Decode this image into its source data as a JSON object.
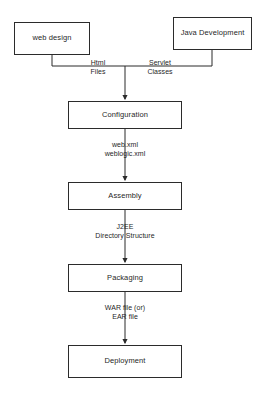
{
  "diagram": {
    "type": "flowchart",
    "background_color": "#ffffff",
    "line_color": "#2b2b2b",
    "text_color": "#1f1f1f",
    "nodes": [
      {
        "id": "web-design",
        "label": "web design",
        "x": 14,
        "y": 22,
        "w": 76,
        "h": 33
      },
      {
        "id": "java-development",
        "label": "Java Development",
        "x": 173,
        "y": 17,
        "w": 79,
        "h": 33
      },
      {
        "id": "configuration",
        "label": "Configuration",
        "x": 68,
        "y": 101,
        "w": 114,
        "h": 28
      },
      {
        "id": "assembly",
        "label": "Assembly",
        "x": 68,
        "y": 182,
        "w": 114,
        "h": 28
      },
      {
        "id": "packaging",
        "label": "Packaging",
        "x": 68,
        "y": 264,
        "w": 114,
        "h": 28
      },
      {
        "id": "deployment",
        "label": "Deployment",
        "x": 68,
        "y": 345,
        "w": 114,
        "h": 33
      }
    ],
    "edge_labels": [
      {
        "id": "html-files",
        "lines": [
          "Html",
          "Files"
        ],
        "from": "web-design",
        "to": "configuration",
        "x": 72,
        "y": 60
      },
      {
        "id": "servlet-classes",
        "lines": [
          "Servlet",
          "Classes"
        ],
        "from": "java-development",
        "to": "configuration",
        "x": 133,
        "y": 60
      },
      {
        "id": "web-xml-weblogic-xml",
        "lines": [
          "web.xml",
          "weblogic.xml"
        ],
        "from": "configuration",
        "to": "assembly",
        "x": 65,
        "y": 142
      },
      {
        "id": "j2ee-directory-structure",
        "lines": [
          "J2EE",
          "Directory Structure"
        ],
        "from": "assembly",
        "to": "packaging",
        "x": 65,
        "y": 224
      },
      {
        "id": "war-ear-file",
        "lines": [
          "WAR file (or)",
          "EAR file"
        ],
        "from": "packaging",
        "to": "deployment",
        "x": 65,
        "y": 305
      }
    ]
  }
}
